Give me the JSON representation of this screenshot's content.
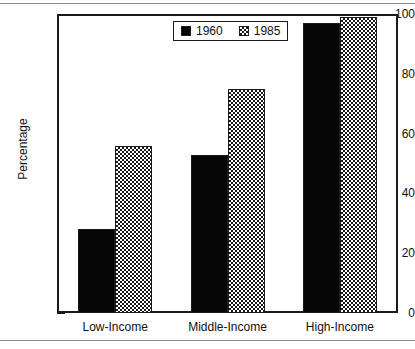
{
  "chart_data": {
    "type": "bar",
    "title": "",
    "xlabel": "",
    "ylabel": "Percentage",
    "categories": [
      "Low-Income",
      "Middle-Income",
      "High-Income"
    ],
    "series": [
      {
        "name": "1960",
        "values": [
          28,
          53,
          97
        ],
        "fill": "solid-black",
        "color": "#050505"
      },
      {
        "name": "1985",
        "values": [
          56,
          75,
          99
        ],
        "fill": "checkerboard",
        "color": "#1a1a1a"
      }
    ],
    "ylim": [
      0,
      100
    ],
    "ytick_labels": [
      "0",
      "20",
      "40",
      "60",
      "80",
      "100"
    ],
    "ytick_values": [
      0,
      20,
      40,
      60,
      80,
      100
    ],
    "yminor_values": [
      10,
      30,
      50,
      70,
      90
    ],
    "grid": false,
    "legend_position": "top-center",
    "frame_color": "#1a1a1a",
    "background": "#ffffff"
  },
  "legend": {
    "items": [
      {
        "label": "1960",
        "swatch": "solid-black-square"
      },
      {
        "label": "1985",
        "swatch": "checkered-square"
      }
    ]
  }
}
